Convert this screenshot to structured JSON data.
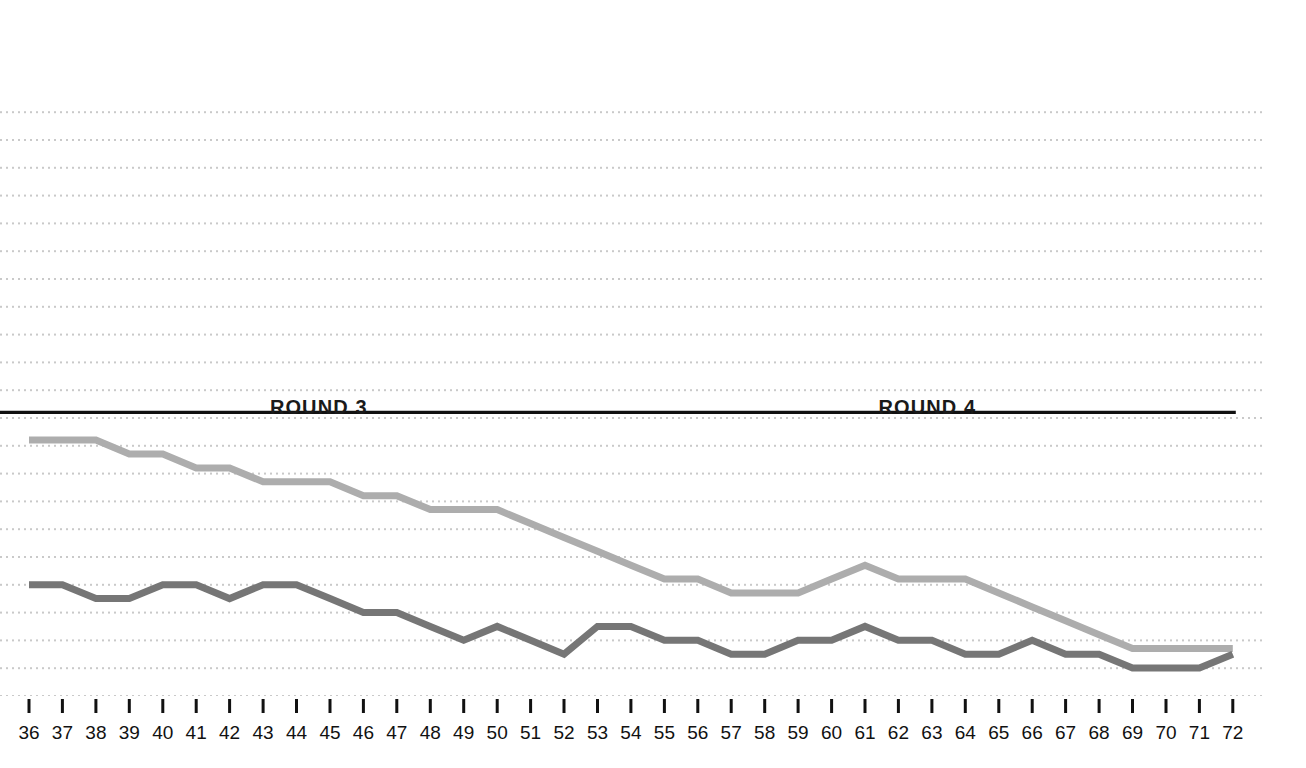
{
  "chart_data": {
    "type": "line",
    "title": "",
    "subtitle": "",
    "xlabel": "",
    "ylabel": "",
    "grid": "horizontal-dotted",
    "legend_position": "none",
    "xlim": [
      36,
      72
    ],
    "ylim": [
      0,
      11
    ],
    "x": [
      36,
      37,
      38,
      39,
      40,
      41,
      42,
      43,
      44,
      45,
      46,
      47,
      48,
      49,
      50,
      51,
      52,
      53,
      54,
      55,
      56,
      57,
      58,
      59,
      60,
      61,
      62,
      63,
      64,
      65,
      66,
      67,
      68,
      69,
      70,
      71,
      72
    ],
    "xticklabels": [
      "36",
      "37",
      "38",
      "39",
      "40",
      "41",
      "42",
      "43",
      "44",
      "45",
      "46",
      "47",
      "48",
      "49",
      "50",
      "51",
      "52",
      "53",
      "54",
      "55",
      "56",
      "57",
      "58",
      "59",
      "60",
      "61",
      "62",
      "63",
      "64",
      "65",
      "66",
      "67",
      "68",
      "69",
      "70",
      "71",
      "72"
    ],
    "series": [
      {
        "name": "light-gray-line",
        "color": "#adadad",
        "values": [
          9.6,
          9.6,
          9.6,
          9.1,
          9.1,
          8.6,
          8.6,
          8.1,
          8.1,
          8.1,
          7.6,
          7.6,
          7.1,
          7.1,
          7.1,
          6.6,
          6.1,
          5.6,
          5.1,
          4.6,
          4.6,
          4.1,
          4.1,
          4.1,
          4.6,
          5.1,
          4.6,
          4.6,
          4.6,
          4.1,
          3.6,
          3.1,
          2.6,
          2.1,
          2.1,
          2.1,
          2.1
        ]
      },
      {
        "name": "dark-gray-line",
        "color": "#767676",
        "values": [
          4.4,
          4.4,
          3.9,
          3.9,
          4.4,
          4.4,
          3.9,
          4.4,
          4.4,
          3.9,
          3.4,
          3.4,
          2.9,
          2.4,
          2.9,
          2.4,
          1.9,
          2.9,
          2.9,
          2.4,
          2.4,
          1.9,
          1.9,
          2.4,
          2.4,
          2.9,
          2.4,
          2.4,
          1.9,
          1.9,
          2.4,
          1.9,
          1.9,
          1.4,
          1.4,
          1.4,
          1.9
        ]
      }
    ],
    "reference_line": {
      "name": "black-reference-line",
      "color": "#111111",
      "y": 10.6,
      "x_start": 36,
      "x_end": 72
    },
    "annotations": [
      {
        "name": "round-3",
        "label": "ROUND 3",
        "x": 44.7
      },
      {
        "name": "round-4",
        "label": "ROUND 4",
        "x": 62.9
      }
    ]
  },
  "labels": {
    "round3": "ROUND 3",
    "round4": "ROUND 4"
  },
  "colors": {
    "light_series": "#adadad",
    "dark_series": "#767676",
    "reference_line": "#111111",
    "grid_dot": "#c9c9c9",
    "tick": "#111111",
    "background": "#ffffff"
  }
}
